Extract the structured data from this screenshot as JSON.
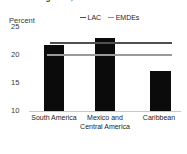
{
  "title": "Investment growth, 2010-19",
  "legend": {
    "items": [
      {
        "label": "LAC",
        "color": "#4d4d4d",
        "dash": "em-dash"
      },
      {
        "label": "EMDEs",
        "color": "#8e8e8e",
        "dash": "em-dash"
      }
    ]
  },
  "axis": {
    "unit_label": "Percent",
    "ticks": [
      "25",
      "20",
      "15",
      "10"
    ]
  },
  "chart_data": {
    "type": "bar",
    "title": "Investment growth, 2010-19",
    "xlabel": "",
    "ylabel": "Percent",
    "ylim": [
      10,
      25
    ],
    "yticks": [
      10,
      15,
      20,
      25
    ],
    "grid": false,
    "legend_position": "top-right",
    "categories": [
      "South America",
      "Mexico and Central America",
      "Caribbean"
    ],
    "values": [
      21.6,
      22.9,
      17.0
    ],
    "bar_color": "#0b0b0b",
    "reference_lines": [
      {
        "name": "LAC",
        "value": 22.0,
        "color": "#4f4f4f"
      },
      {
        "name": "EMDEs",
        "value": 19.9,
        "color": "#9a9a9a"
      }
    ]
  }
}
